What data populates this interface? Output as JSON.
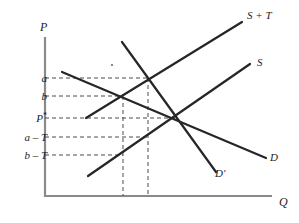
{
  "figure": {
    "kind": "supply-demand-tax-incidence-diagram",
    "axes": {
      "y_axis_label": "P",
      "x_axis_label": "Q",
      "origin": {
        "x": 45,
        "y": 196
      },
      "y_axis_top": 37,
      "x_axis_right": 272
    },
    "price_ticks": [
      {
        "id": "a",
        "label": "a",
        "y": 78,
        "guide_to_x": 148
      },
      {
        "id": "b",
        "label": "b",
        "y": 96,
        "guide_to_x": 123
      },
      {
        "id": "pstar",
        "label": "P*",
        "y": 118,
        "guide_to_x": 175
      },
      {
        "id": "a-T",
        "label": "a – T",
        "y": 137,
        "guide_to_x": 148
      },
      {
        "id": "b-T",
        "label": "b – T",
        "y": 155,
        "guide_to_x": 123
      }
    ],
    "quantity_guides": [
      {
        "id": "q-low",
        "x": 123,
        "from_y": 96,
        "to_y": 196
      },
      {
        "id": "q-high",
        "x": 148,
        "from_y": 78,
        "to_y": 196
      }
    ],
    "curves": [
      {
        "id": "supply-plus-tax",
        "label": "S + T",
        "label_x": 247,
        "label_y": 10,
        "x1": 86,
        "y1": 118,
        "x2": 242,
        "y2": 22
      },
      {
        "id": "supply",
        "label": "S",
        "label_x": 257,
        "label_y": 57,
        "x1": 88,
        "y1": 176,
        "x2": 250,
        "y2": 64
      },
      {
        "id": "demand",
        "label": "D",
        "label_x": 270,
        "label_y": 152,
        "x1": 62,
        "y1": 72,
        "x2": 266,
        "y2": 158
      },
      {
        "id": "demand-prime",
        "label": "D'",
        "label_x": 215,
        "label_y": 168,
        "x1": 122,
        "y1": 42,
        "x2": 216,
        "y2": 172
      }
    ],
    "intersections": [
      {
        "id": "supply-plus-tax-x-demand-prime",
        "x": 148,
        "y": 78
      },
      {
        "id": "supply-x-demand-prime",
        "x": 123,
        "y": 96
      },
      {
        "id": "equilibrium",
        "x": 175,
        "y": 118
      }
    ],
    "speck": {
      "x": 112,
      "y": 65,
      "r": 1.1
    },
    "colors": {
      "curve": "#262626",
      "axis": "#8a8a8a",
      "guide": "#4a4a4a",
      "background": "#ffffff",
      "text": "#1c1c1c"
    }
  },
  "chart_data": {
    "type": "line",
    "title": "",
    "xlabel": "Q",
    "ylabel": "P",
    "grid": false,
    "legend": "inline-curve-labels",
    "annotations": [
      "a",
      "b",
      "P*",
      "a – T",
      "b – T"
    ],
    "series": [
      {
        "name": "S + T",
        "note": "supply curve shifted up by per-unit tax T",
        "points": [
          [
            86,
            118
          ],
          [
            242,
            22
          ]
        ]
      },
      {
        "name": "S",
        "note": "original upward-sloping supply curve",
        "points": [
          [
            88,
            176
          ],
          [
            250,
            64
          ]
        ]
      },
      {
        "name": "D",
        "note": "flatter, more elastic demand curve",
        "points": [
          [
            62,
            72
          ],
          [
            266,
            158
          ]
        ]
      },
      {
        "name": "D'",
        "note": "steeper, less elastic demand curve",
        "points": [
          [
            122,
            42
          ],
          [
            216,
            172
          ]
        ]
      }
    ],
    "key_points": [
      {
        "name": "S+T meets D'",
        "price_label": "a",
        "quantity_guide": "q-high"
      },
      {
        "name": "S meets D'",
        "price_label": "b",
        "quantity_guide": "q-low"
      },
      {
        "name": "pre-tax equilibrium (S meets D)",
        "price_label": "P*"
      },
      {
        "name": "seller price under D'",
        "price_label": "a – T"
      },
      {
        "name": "seller price under D",
        "price_label": "b – T"
      }
    ]
  }
}
